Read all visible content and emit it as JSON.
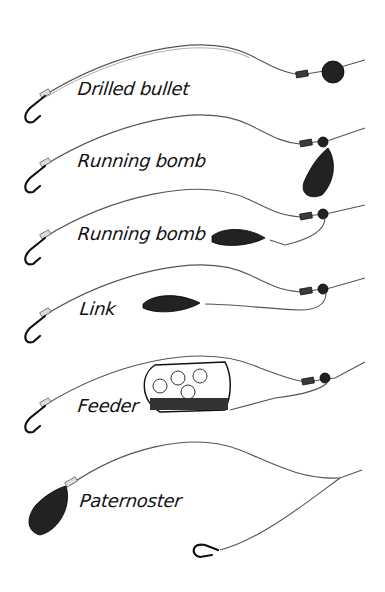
{
  "figure": {
    "type": "illustration",
    "rigs": [
      {
        "label": "Drilled bullet",
        "weight": "drilled-bullet",
        "icon": "hook-icon"
      },
      {
        "label": "Running bomb",
        "weight": "hanging-bomb",
        "icon": "hook-icon"
      },
      {
        "label": "Running bomb",
        "weight": "bomb-on-link",
        "icon": "hook-icon"
      },
      {
        "label": "Link",
        "weight": "bomb-on-link-line",
        "icon": "hook-icon"
      },
      {
        "label": "Feeder",
        "weight": "cage-feeder",
        "icon": "hook-icon"
      },
      {
        "label": "Paternoster",
        "weight": "bomb-at-end",
        "icon": "hook-icon"
      }
    ],
    "colors": {
      "ink": "#111111",
      "line": "#555555",
      "background": "#ffffff"
    }
  }
}
